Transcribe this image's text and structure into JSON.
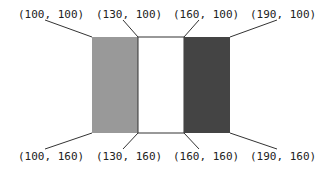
{
  "diagram": {
    "rects": [
      {
        "name": "gray-rect",
        "x": 92,
        "y": 37,
        "w": 46,
        "h": 96,
        "fill": "#999999"
      },
      {
        "name": "white-rect",
        "x": 138,
        "y": 37,
        "w": 46,
        "h": 96,
        "fill": "#ffffff"
      },
      {
        "name": "dark-rect",
        "x": 184,
        "y": 37,
        "w": 46,
        "h": 96,
        "fill": "#444444"
      }
    ],
    "labels": {
      "tl1": "(100, 100)",
      "tl2": "(130, 100)",
      "tl3": "(160, 100)",
      "tl4": "(190, 100)",
      "bl1": "(100, 160)",
      "bl2": "(130, 160)",
      "bl3": "(160, 160)",
      "bl4": "(190, 160)"
    }
  }
}
